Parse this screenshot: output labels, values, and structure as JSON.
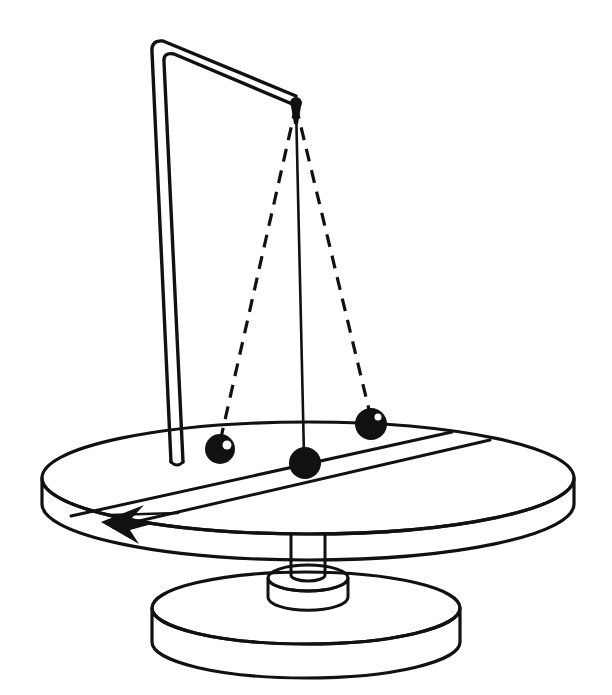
{
  "figure": {
    "style": "black-and-white line art",
    "background_color": "#ffffff",
    "ink_color": "#111111",
    "canvas": {
      "width": 612,
      "height": 695
    }
  },
  "geometry": {
    "support": {
      "name": "bent-tube-support",
      "description": "Vertical tube rising from the turntable, bending at a right-angle elbow at the top and running to the right to an overhead pivot",
      "render": "double-line tube (two parallel outlines) with rounded elbow",
      "elbow_point": {
        "x": 158,
        "y": 45
      },
      "foot_point": {
        "x": 180,
        "y": 462
      },
      "arm_end_point": {
        "x": 296,
        "y": 100
      },
      "tube_width": 9,
      "stroke_width": 3.4
    },
    "pivot": {
      "name": "overhead-pivot-point",
      "x": 296,
      "y": 103,
      "radius": 6,
      "filled": true
    },
    "strings": [
      {
        "name": "string-left-dashed",
        "style": "dashed",
        "from": {
          "x": 296,
          "y": 106
        },
        "to": {
          "x": 220,
          "y": 442
        },
        "dash_pattern": "13 9",
        "stroke_width": 3.2
      },
      {
        "name": "string-center-solid",
        "style": "solid",
        "from": {
          "x": 296,
          "y": 106
        },
        "to": {
          "x": 304,
          "y": 455
        },
        "stroke_width": 2.6
      },
      {
        "name": "string-right-dashed",
        "style": "dashed",
        "from": {
          "x": 296,
          "y": 106
        },
        "to": {
          "x": 371,
          "y": 418
        },
        "dash_pattern": "13 9",
        "stroke_width": 3.2
      }
    ],
    "bobs": [
      {
        "name": "pendulum-bob-left",
        "x": 220,
        "y": 449,
        "rx": 15,
        "ry": 15,
        "highlight": {
          "x": 227,
          "y": 445,
          "r": 4.5
        },
        "position_label": "small-radius position"
      },
      {
        "name": "pendulum-bob-center",
        "x": 305,
        "y": 463,
        "rx": 16,
        "ry": 16,
        "highlight": null,
        "position_label": "rest / reference position"
      },
      {
        "name": "pendulum-bob-right",
        "x": 371,
        "y": 424,
        "rx": 16,
        "ry": 16,
        "highlight": {
          "x": 378,
          "y": 417,
          "r": 3.5
        },
        "position_label": "large-radius position"
      }
    ],
    "turntable": {
      "name": "rotating-turntable",
      "center": {
        "x": 308,
        "y": 478
      },
      "rx": 266,
      "ry": 56,
      "thickness": 26,
      "stroke_width": 3.2,
      "band": {
        "name": "diametral-band-stripe",
        "description": "Two parallel chord lines crossing the top face of the turntable from lower-left to upper-right",
        "line_a": {
          "x1": 71,
          "y1": 516,
          "x2": 452,
          "y2": 432
        },
        "line_b": {
          "x1": 113,
          "y1": 527,
          "x2": 490,
          "y2": 440
        },
        "stroke_width": 3.0
      },
      "rotation_arrow": {
        "name": "rotation-direction-arrow",
        "tip": {
          "x": 101,
          "y": 522
        },
        "description": "Solid arrowhead on the near rim showing the sense of rotation",
        "direction": "counter-clockwise viewed from above (toward viewer-left along near rim)"
      }
    },
    "shaft": {
      "name": "drive-shaft",
      "x": 308,
      "top_y": 534,
      "bottom_y": 585,
      "width": 34,
      "stroke_width": 3.0
    },
    "hub": {
      "name": "motor-hub-cylinder",
      "center": {
        "x": 308,
        "y": 578
      },
      "rx": 40,
      "ry": 13,
      "height": 33,
      "stroke_width": 3.0
    },
    "base": {
      "name": "base-disk",
      "center": {
        "x": 306,
        "y": 608
      },
      "rx": 154,
      "ry": 36,
      "thickness": 34,
      "stroke_width": 3.2
    }
  },
  "labels": {
    "annotations": [],
    "note": "The original figure contains no text labels, captions, axis ticks or legend entries."
  }
}
